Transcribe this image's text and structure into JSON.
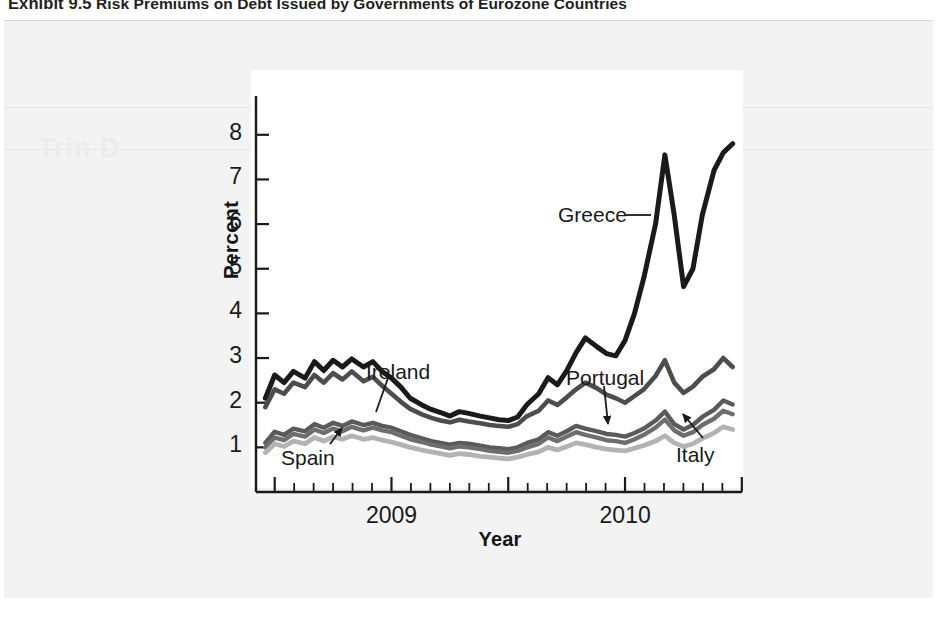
{
  "caption": {
    "exhibit_number": "Exhibit 9.5",
    "title": "Risk Premiums on Debt Issued by Governments of Eurozone Countries"
  },
  "ghost_text": "Trin D",
  "chart_data": {
    "type": "line",
    "title": "Risk Premiums on Debt Issued by Governments of Eurozone Countries",
    "xlabel": "Year",
    "ylabel": "Percent",
    "ylim": [
      0,
      8.6
    ],
    "yticks": [
      1,
      2,
      3,
      4,
      5,
      6,
      7,
      8
    ],
    "xlim": [
      2008.42,
      2010.5
    ],
    "xtick_labels": [
      "2009",
      "2010"
    ],
    "xtick_label_positions": [
      2009.0,
      2010.0
    ],
    "x_major_ticks": [
      2008.5,
      2009.0,
      2009.5,
      2010.0,
      2010.5
    ],
    "x_minor_tick_step": 0.0833,
    "grid": false,
    "legend": "inline-annotations",
    "colors": {
      "Greece": "#1a1a1a",
      "Ireland": "#4d4d4d",
      "Portugal": "#5a5a5a",
      "Spain": "#6e6e6e",
      "Italy": "#b3b3b3"
    },
    "annotations": [
      {
        "label": "Greece",
        "x_px": 558,
        "y_px": 203,
        "leader": "right-horizontal"
      },
      {
        "label": "Ireland",
        "x_px": 366,
        "y_px": 360,
        "leader": "down-left"
      },
      {
        "label": "Portugal",
        "x_px": 566,
        "y_px": 366,
        "leader": "down-arrow"
      },
      {
        "label": "Spain",
        "x_px": 281,
        "y_px": 446,
        "leader": "up-right-arrow"
      },
      {
        "label": "Italy",
        "x_px": 676,
        "y_px": 443,
        "leader": "up-left-arrow"
      }
    ],
    "x": [
      2008.46,
      2008.5,
      2008.54,
      2008.58,
      2008.63,
      2008.67,
      2008.71,
      2008.75,
      2008.79,
      2008.83,
      2008.88,
      2008.92,
      2008.96,
      2009.0,
      2009.04,
      2009.08,
      2009.13,
      2009.17,
      2009.21,
      2009.25,
      2009.29,
      2009.33,
      2009.38,
      2009.42,
      2009.46,
      2009.5,
      2009.54,
      2009.58,
      2009.63,
      2009.67,
      2009.71,
      2009.75,
      2009.79,
      2009.83,
      2009.88,
      2009.92,
      2009.96,
      2010.0,
      2010.04,
      2010.08,
      2010.13,
      2010.17,
      2010.21,
      2010.25,
      2010.29,
      2010.33,
      2010.38,
      2010.42,
      2010.46
    ],
    "series": [
      {
        "name": "Greece",
        "values": [
          2.1,
          2.62,
          2.45,
          2.7,
          2.55,
          2.92,
          2.72,
          2.95,
          2.8,
          2.98,
          2.8,
          2.92,
          2.7,
          2.55,
          2.35,
          2.1,
          1.95,
          1.85,
          1.78,
          1.7,
          1.8,
          1.76,
          1.7,
          1.66,
          1.62,
          1.6,
          1.68,
          1.96,
          2.2,
          2.56,
          2.4,
          2.72,
          3.12,
          3.45,
          3.25,
          3.1,
          3.05,
          3.4,
          4.0,
          4.8,
          6.0,
          7.55,
          6.2,
          4.6,
          5.0,
          6.2,
          7.2,
          7.6,
          7.8
        ]
      },
      {
        "name": "Ireland",
        "values": [
          1.9,
          2.3,
          2.2,
          2.45,
          2.35,
          2.62,
          2.45,
          2.66,
          2.52,
          2.7,
          2.48,
          2.58,
          2.38,
          2.2,
          2.02,
          1.86,
          1.74,
          1.66,
          1.6,
          1.56,
          1.62,
          1.58,
          1.54,
          1.5,
          1.48,
          1.46,
          1.52,
          1.7,
          1.82,
          2.05,
          1.95,
          2.12,
          2.3,
          2.45,
          2.32,
          2.18,
          2.1,
          2.0,
          2.15,
          2.3,
          2.6,
          2.95,
          2.45,
          2.22,
          2.36,
          2.58,
          2.75,
          3.0,
          2.8
        ]
      },
      {
        "name": "Portugal",
        "values": [
          1.1,
          1.35,
          1.28,
          1.42,
          1.36,
          1.52,
          1.44,
          1.55,
          1.48,
          1.58,
          1.5,
          1.55,
          1.48,
          1.44,
          1.36,
          1.28,
          1.2,
          1.14,
          1.1,
          1.06,
          1.1,
          1.08,
          1.04,
          1.0,
          0.98,
          0.96,
          1.0,
          1.1,
          1.18,
          1.34,
          1.26,
          1.36,
          1.48,
          1.42,
          1.36,
          1.3,
          1.28,
          1.24,
          1.32,
          1.42,
          1.6,
          1.8,
          1.52,
          1.4,
          1.5,
          1.68,
          1.84,
          2.05,
          1.96
        ]
      },
      {
        "name": "Spain",
        "values": [
          1.0,
          1.22,
          1.16,
          1.3,
          1.24,
          1.4,
          1.32,
          1.42,
          1.36,
          1.46,
          1.38,
          1.44,
          1.38,
          1.34,
          1.26,
          1.18,
          1.12,
          1.06,
          1.02,
          0.98,
          1.02,
          1.0,
          0.96,
          0.92,
          0.9,
          0.88,
          0.92,
          1.0,
          1.08,
          1.22,
          1.14,
          1.24,
          1.34,
          1.28,
          1.22,
          1.16,
          1.14,
          1.1,
          1.18,
          1.28,
          1.44,
          1.62,
          1.38,
          1.26,
          1.34,
          1.5,
          1.64,
          1.82,
          1.74
        ]
      },
      {
        "name": "Italy",
        "values": [
          0.88,
          1.08,
          1.02,
          1.14,
          1.08,
          1.22,
          1.14,
          1.24,
          1.18,
          1.26,
          1.18,
          1.22,
          1.16,
          1.12,
          1.06,
          1.0,
          0.94,
          0.9,
          0.86,
          0.82,
          0.86,
          0.84,
          0.8,
          0.78,
          0.76,
          0.74,
          0.78,
          0.84,
          0.9,
          1.0,
          0.94,
          1.02,
          1.1,
          1.06,
          1.0,
          0.96,
          0.94,
          0.92,
          0.98,
          1.04,
          1.14,
          1.26,
          1.1,
          1.02,
          1.08,
          1.2,
          1.32,
          1.46,
          1.4
        ]
      }
    ]
  }
}
